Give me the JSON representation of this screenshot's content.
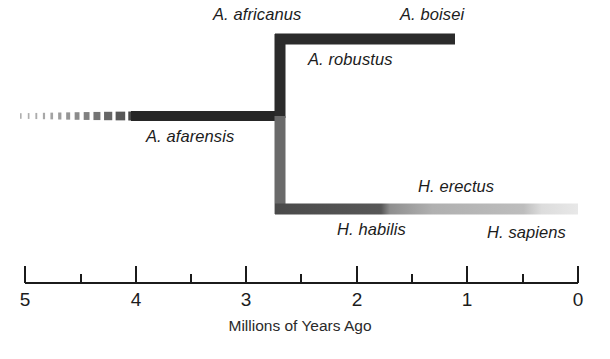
{
  "figure": {
    "type": "cladogram",
    "title_visible": false,
    "background_color": "#ffffff"
  },
  "axis": {
    "title": "Millions of Years Ago",
    "title_x": 300,
    "title_y": 318,
    "unit": "Ma",
    "domain_left_value": 5,
    "domain_right_value": 0,
    "x_at_left_value": 25,
    "x_at_right_value": 578,
    "baseline_y": 283,
    "major_tick_length": 17,
    "minor_tick_length": 9,
    "line_color": "#1b1b1b",
    "line_width": 2,
    "major_ticks": [
      {
        "value": 5,
        "label": "5",
        "x": 25
      },
      {
        "value": 4,
        "label": "4",
        "x": 136
      },
      {
        "value": 3,
        "label": "3",
        "x": 246
      },
      {
        "value": 2,
        "label": "2",
        "x": 357
      },
      {
        "value": 1,
        "label": "1",
        "x": 467
      },
      {
        "value": 0,
        "label": "0",
        "x": 578
      }
    ],
    "minor_ticks": [
      {
        "value": 4.5,
        "x": 81
      },
      {
        "value": 3.5,
        "x": 191
      },
      {
        "value": 2.5,
        "x": 301
      },
      {
        "value": 1.5,
        "x": 412
      },
      {
        "value": 0.5,
        "x": 523
      }
    ],
    "tick_label_y": 290
  },
  "branches": [
    {
      "id": "afarensis-fade",
      "name": "A. afarensis ancestral fade",
      "kind": "horizontal-dashed-fade",
      "y": 116,
      "x_start": 20,
      "x_end": 131,
      "thickness": 9,
      "color": "#9b9b9b",
      "note": "dashes grow from small dots on the left to near-solid on the right"
    },
    {
      "id": "afarensis",
      "name": "A. afarensis",
      "kind": "horizontal",
      "y": 116,
      "x_start": 131,
      "x_end": 285,
      "thickness": 10,
      "color": "#262626",
      "value_start": 4.04,
      "value_end": 2.65
    },
    {
      "id": "trunk-upper",
      "name": "trunk to robust australopith node",
      "kind": "vertical",
      "x": 280,
      "y_start": 34,
      "y_end": 118,
      "thickness": 11,
      "color": "#2b2b2b"
    },
    {
      "id": "trunk-lower",
      "name": "trunk to Homo node",
      "kind": "vertical",
      "x": 280,
      "y_start": 116,
      "y_end": 214,
      "thickness": 11,
      "color": "#6a6a6a"
    },
    {
      "id": "robust-branch",
      "name": "A. africanus / A. robustus / A. boisei branch",
      "kind": "horizontal",
      "y": 39,
      "x_start": 275,
      "x_end": 455,
      "thickness": 11,
      "color": "#2b2b2b",
      "value_start": 2.69,
      "value_end": 1.11
    },
    {
      "id": "homo-branch",
      "name": "Homo branch (habilis to sapiens)",
      "kind": "horizontal-gradient",
      "y": 209,
      "x_start": 275,
      "x_end": 578,
      "thickness": 11,
      "value_start": 2.74,
      "value_end": 0.0,
      "gradient_stops": [
        {
          "pos": 0.0,
          "color": "#4a4a4a"
        },
        {
          "pos": 0.35,
          "color": "#575757"
        },
        {
          "pos": 0.38,
          "color": "#8f8f8f"
        },
        {
          "pos": 0.52,
          "color": "#b0b0b0"
        },
        {
          "pos": 0.82,
          "color": "#bdbdbd"
        },
        {
          "pos": 0.88,
          "color": "#dcdcdc"
        },
        {
          "pos": 1.0,
          "color": "#e8e8e8"
        }
      ]
    }
  ],
  "taxa_labels": [
    {
      "id": "a-africanus",
      "text": "A. africanus",
      "x": 213,
      "y": 6,
      "align": "left"
    },
    {
      "id": "a-boisei",
      "text": "A. boisei",
      "x": 400,
      "y": 6,
      "align": "left"
    },
    {
      "id": "a-robustus",
      "text": "A. robustus",
      "x": 308,
      "y": 51,
      "align": "left"
    },
    {
      "id": "a-afarensis",
      "text": "A. afarensis",
      "x": 146,
      "y": 128,
      "align": "left"
    },
    {
      "id": "h-erectus",
      "text": "H. erectus",
      "x": 418,
      "y": 178,
      "align": "left"
    },
    {
      "id": "h-habilis",
      "text": "H. habilis",
      "x": 337,
      "y": 221,
      "align": "left"
    },
    {
      "id": "h-sapiens",
      "text": "H. sapiens",
      "x": 487,
      "y": 224,
      "align": "left"
    }
  ]
}
